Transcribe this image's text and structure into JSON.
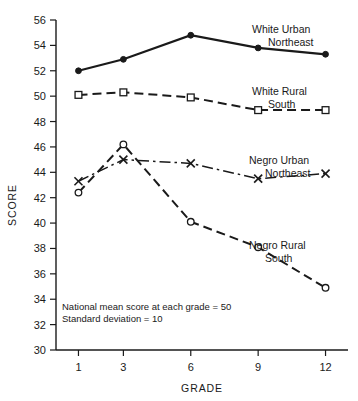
{
  "chart_data": {
    "type": "line",
    "title": "",
    "xlabel": "GRADE",
    "ylabel": "SCORE",
    "x": [
      1,
      3,
      6,
      9,
      12
    ],
    "xtick_labels": [
      "1",
      "3",
      "6",
      "9",
      "12"
    ],
    "ytick_labels": [
      "30",
      "32",
      "34",
      "36",
      "38",
      "40",
      "42",
      "44",
      "46",
      "48",
      "50",
      "52",
      "54",
      "56"
    ],
    "ytick_values": [
      30,
      32,
      34,
      36,
      38,
      40,
      42,
      44,
      46,
      48,
      50,
      52,
      54,
      56
    ],
    "xlim": [
      0,
      13
    ],
    "ylim": [
      30,
      56
    ],
    "grid": false,
    "legend_position": "inline-right",
    "series": [
      {
        "name": "White Urban Northeast",
        "label_line1": "White Urban",
        "label_line2": "Northeast",
        "values": [
          52.0,
          52.9,
          54.8,
          53.8,
          53.3
        ],
        "line_style": "solid",
        "marker": "filled-circle",
        "color": "#1a1a1a",
        "label_x": 252,
        "label_y": 33
      },
      {
        "name": "White Rural South",
        "label_line1": "White Rural",
        "label_line2": "South",
        "values": [
          50.1,
          50.3,
          49.9,
          48.9,
          48.9
        ],
        "line_style": "dashed",
        "marker": "open-square",
        "color": "#1a1a1a",
        "label_x": 252,
        "label_y": 95
      },
      {
        "name": "Negro Urban Northeast",
        "label_line1": "Negro Urban",
        "label_line2": "Northeast",
        "values": [
          43.3,
          45.0,
          44.7,
          43.5,
          43.9
        ],
        "line_style": "dash-dot",
        "marker": "x",
        "color": "#1a1a1a",
        "label_x": 249,
        "label_y": 164
      },
      {
        "name": "Negro Rural South",
        "label_line1": "Negro Rural",
        "label_line2": "South",
        "values": [
          42.4,
          46.2,
          40.1,
          38.1,
          34.9
        ],
        "line_style": "dashed",
        "marker": "open-circle",
        "color": "#1a1a1a",
        "label_x": 249,
        "label_y": 249
      }
    ],
    "annotations": [
      {
        "text": "National mean score at each grade = 50",
        "x": 62,
        "y": 310
      },
      {
        "text": "Standard deviation = 10",
        "x": 62,
        "y": 322
      }
    ]
  }
}
